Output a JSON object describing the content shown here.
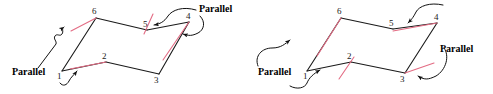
{
  "figure": {
    "colors": {
      "black_edge": "#1a1a1a",
      "red_edge": "#e36c84",
      "annotation": "#111111",
      "background": "#ffffff"
    },
    "diagrams": [
      {
        "id": "left-diagram",
        "name": "left-parallel-diagram",
        "vertices": [
          {
            "id": "v1",
            "label": "1",
            "x": 62,
            "y": 71,
            "label_x": 57,
            "label_y": 79
          },
          {
            "id": "v2",
            "label": "2",
            "x": 106,
            "y": 62,
            "label_x": 102,
            "label_y": 59
          },
          {
            "id": "v3",
            "label": "3",
            "x": 159,
            "y": 74,
            "label_x": 154,
            "label_y": 83
          },
          {
            "id": "v4",
            "label": "4",
            "x": 189,
            "y": 22,
            "label_x": 186,
            "label_y": 19
          },
          {
            "id": "v5",
            "label": "5",
            "x": 147,
            "y": 30,
            "label_x": 143,
            "label_y": 27
          },
          {
            "id": "v6",
            "label": "6",
            "x": 96,
            "y": 18,
            "label_x": 92,
            "label_y": 14
          }
        ],
        "edges_black": [
          {
            "from": "v1",
            "to": "v6"
          },
          {
            "from": "v6",
            "to": "v5"
          },
          {
            "from": "v5",
            "to": "v4"
          },
          {
            "from": "v1",
            "to": "v2"
          },
          {
            "from": "v2",
            "to": "v3"
          },
          {
            "from": "v3",
            "to": "v4"
          }
        ],
        "edges_red": [
          {
            "name": "red-segment-near-6",
            "x1": 71,
            "y1": 31,
            "x2": 96,
            "y2": 18
          },
          {
            "name": "red-segment-near-2",
            "x1": 70,
            "y1": 69,
            "x2": 106,
            "y2": 62
          },
          {
            "name": "red-segment-near-5",
            "x1": 153,
            "y1": 14,
            "x2": 144,
            "y2": 34
          },
          {
            "name": "red-segment-near-4",
            "x1": 189,
            "y1": 22,
            "x2": 163,
            "y2": 60
          }
        ],
        "labels": [
          {
            "name": "parallel-label-left",
            "text": "Parallel",
            "x": 12,
            "y": 75
          },
          {
            "name": "parallel-label-top-right",
            "text": "Parallel",
            "x": 199,
            "y": 12
          }
        ]
      },
      {
        "id": "right-diagram",
        "name": "right-parallel-diagram",
        "vertices": [
          {
            "id": "v1",
            "label": "1",
            "x": 307,
            "y": 71,
            "label_x": 303,
            "label_y": 79
          },
          {
            "id": "v2",
            "label": "2",
            "x": 351,
            "y": 62,
            "label_x": 347,
            "label_y": 59
          },
          {
            "id": "v3",
            "label": "3",
            "x": 405,
            "y": 73,
            "label_x": 400,
            "label_y": 82
          },
          {
            "id": "v4",
            "label": "4",
            "x": 437,
            "y": 23,
            "label_x": 434,
            "label_y": 20
          },
          {
            "id": "v5",
            "label": "5",
            "x": 393,
            "y": 29,
            "label_x": 389,
            "label_y": 26
          },
          {
            "id": "v6",
            "label": "6",
            "x": 341,
            "y": 18,
            "label_x": 337,
            "label_y": 14
          }
        ],
        "edges_black": [
          {
            "from": "v1",
            "to": "v6"
          },
          {
            "from": "v6",
            "to": "v5"
          },
          {
            "from": "v5",
            "to": "v4"
          },
          {
            "from": "v1",
            "to": "v2"
          },
          {
            "from": "v2",
            "to": "v3"
          },
          {
            "from": "v3",
            "to": "v4"
          }
        ],
        "edges_red": [
          {
            "name": "red-segment-near-6",
            "x1": 317,
            "y1": 56,
            "x2": 341,
            "y2": 18
          },
          {
            "name": "red-segment-near-2",
            "x1": 339,
            "y1": 79,
            "x2": 354,
            "y2": 57
          },
          {
            "name": "red-segment-near-5-4",
            "x1": 393,
            "y1": 31,
            "x2": 437,
            "y2": 23
          },
          {
            "name": "red-segment-near-3",
            "x1": 405,
            "y1": 73,
            "x2": 434,
            "y2": 63
          }
        ],
        "labels": [
          {
            "name": "parallel-label-left",
            "text": "Parallel",
            "x": 258,
            "y": 75
          },
          {
            "name": "parallel-label-right",
            "text": "Parallel",
            "x": 440,
            "y": 52
          }
        ]
      }
    ]
  }
}
